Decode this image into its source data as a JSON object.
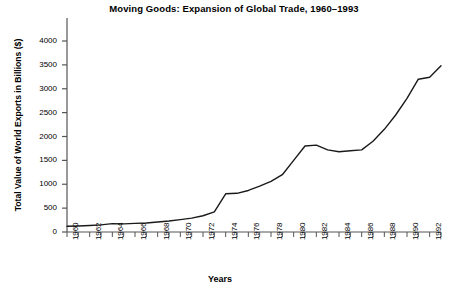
{
  "chart_data": {
    "type": "line",
    "title": "Moving Goods: Expansion of Global Trade, 1960–1993",
    "xlabel": "Years",
    "ylabel": "Total Value of World Exports in Billions ($)",
    "xlim": [
      1960,
      1993
    ],
    "ylim": [
      0,
      4200
    ],
    "grid": false,
    "legend": null,
    "ytick_labels": [
      "0",
      "500",
      "1000",
      "1500",
      "2000",
      "2500",
      "3000",
      "3500",
      "4000"
    ],
    "ytick_values": [
      0,
      500,
      1000,
      1500,
      2000,
      2500,
      3000,
      3500,
      4000
    ],
    "xtick_labels": [
      "1960",
      "1962",
      "1964",
      "1966",
      "1968",
      "1970",
      "1972",
      "1974",
      "1976",
      "1978",
      "1980",
      "1982",
      "1984",
      "1986",
      "1988",
      "1990",
      "1992"
    ],
    "xtick_values": [
      1960,
      1962,
      1964,
      1966,
      1968,
      1970,
      1972,
      1974,
      1976,
      1978,
      1980,
      1982,
      1984,
      1986,
      1988,
      1990,
      1992
    ],
    "minor_xticks": [
      1960,
      1961,
      1962,
      1963,
      1964,
      1965,
      1966,
      1967,
      1968,
      1969,
      1970,
      1971,
      1972,
      1973,
      1974,
      1975,
      1976,
      1977,
      1978,
      1979,
      1980,
      1981,
      1982,
      1983,
      1984,
      1985,
      1986,
      1987,
      1988,
      1989,
      1990,
      1991,
      1992,
      1993
    ],
    "x": [
      1960,
      1961,
      1962,
      1963,
      1964,
      1965,
      1966,
      1967,
      1968,
      1969,
      1970,
      1971,
      1972,
      1973,
      1974,
      1975,
      1976,
      1977,
      1978,
      1979,
      1980,
      1981,
      1982,
      1983,
      1984,
      1985,
      1986,
      1987,
      1988,
      1989,
      1990,
      1991,
      1992,
      1993
    ],
    "values": [
      120,
      125,
      135,
      150,
      175,
      170,
      180,
      190,
      210,
      230,
      260,
      290,
      340,
      420,
      800,
      810,
      870,
      960,
      1060,
      1200,
      1500,
      1800,
      1820,
      1720,
      1680,
      1700,
      1720,
      1900,
      2150,
      2450,
      2800,
      3200,
      3240,
      3480
    ],
    "line_color": "#1a1a1a",
    "axis_color": "#555555"
  }
}
